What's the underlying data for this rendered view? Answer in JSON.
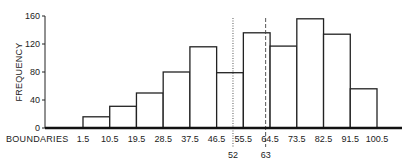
{
  "chart_data": {
    "type": "bar",
    "subtype": "histogram",
    "title": "",
    "xlabel": "BOUNDARIES",
    "ylabel": "FREQUENCY",
    "ylim": [
      0,
      160
    ],
    "yticks": [
      0,
      40,
      80,
      120,
      160
    ],
    "boundaries": [
      1.5,
      10.5,
      19.5,
      28.5,
      37.5,
      46.5,
      55.5,
      64.5,
      73.5,
      82.5,
      91.5,
      100.5
    ],
    "boundary_labels": [
      "1.5",
      "10.5",
      "19.5",
      "28.5",
      "37.5",
      "46.5",
      "55.5",
      "64.5",
      "73.5",
      "82.5",
      "91.5",
      "100.5"
    ],
    "values": [
      16,
      31,
      50,
      80,
      116,
      79,
      136,
      117,
      156,
      134,
      56
    ],
    "reference_lines": [
      {
        "x": 52,
        "label": "52",
        "style": "dotted"
      },
      {
        "x": 63,
        "label": "63",
        "style": "dashed"
      }
    ],
    "grid": false,
    "legend": "none"
  }
}
